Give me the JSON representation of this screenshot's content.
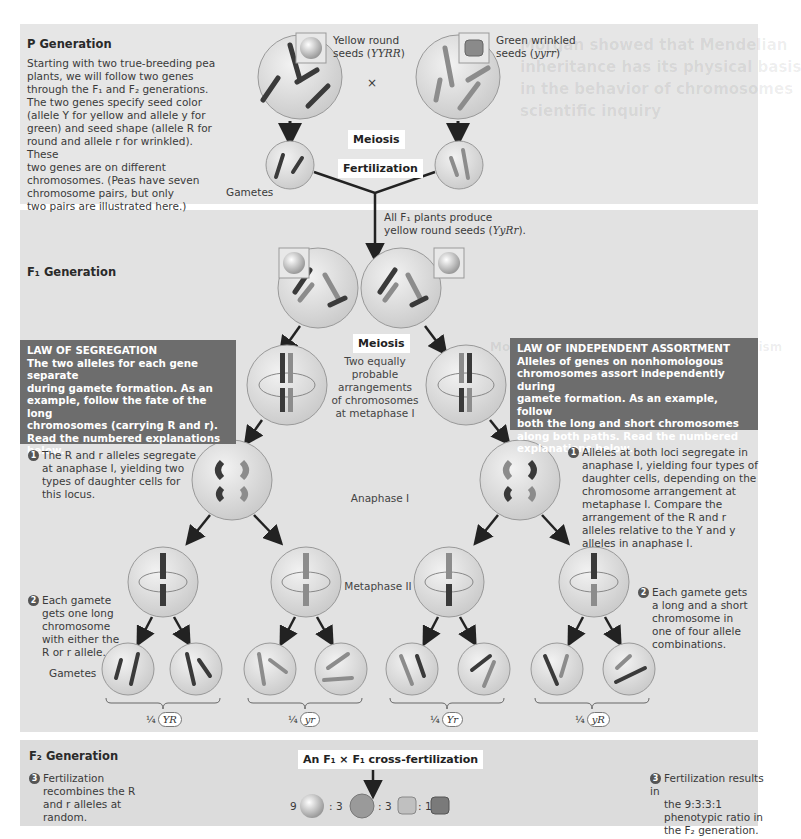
{
  "background_bleed": {
    "lines": [
      "Morgan showed that Mendelian",
      "inheritance has its physical basis",
      "in the behavior of chromosomes",
      "scientific inquiry"
    ],
    "subheading": "Morgan's Choice of Experimental Organism"
  },
  "p_generation": {
    "heading": "P Generation",
    "description": [
      "Starting with two true-breeding pea",
      "plants, we will follow two genes",
      "through the F₁ and F₂ generations.",
      "The two genes specify seed color",
      "(allele Y for yellow and allele y for",
      "green) and seed shape (allele R for",
      "round and allele r for wrinkled). These",
      "two genes are on different",
      "chromosomes. (Peas have seven",
      "chromosome pairs, but only",
      "two pairs are illustrated here.)"
    ],
    "parent_left": {
      "label_line1": "Yellow round",
      "label_line2": "seeds (",
      "genotype": "YYRR",
      "label_end": ")"
    },
    "cross_symbol": "×",
    "parent_right": {
      "label_line1": "Green wrinkled",
      "label_line2": "seeds (",
      "genotype": "yyrr",
      "label_end": ")"
    },
    "meiosis_label": "Meiosis",
    "fertilization_label": "Fertilization",
    "gametes_label": "Gametes",
    "gamete_left_alleles": [
      "R",
      "Y"
    ],
    "gamete_right_alleles": [
      "y",
      "r"
    ]
  },
  "f1_generation": {
    "heading": "F₁ Generation",
    "all_f1_line1": "All F₁ plants produce",
    "all_f1_line2": "yellow round seeds (",
    "all_f1_genotype": "YyRr",
    "all_f1_end": ").",
    "meiosis_label": "Meiosis",
    "metaphase1_label": [
      "Two equally",
      "probable",
      "arrangements",
      "of chromosomes",
      "at metaphase I"
    ],
    "anaphase1_label": "Anaphase I",
    "metaphase2_label": "Metaphase II",
    "gametes_label": "Gametes",
    "law_of_segregation": {
      "title": "LAW OF SEGREGATION",
      "text": [
        "The two alleles for each gene separate",
        "during gamete formation. As an",
        "example, follow the fate of the long",
        "chromosomes (carrying R and r).",
        "Read the numbered explanations",
        "below."
      ]
    },
    "law_of_independent_assortment": {
      "title": "LAW OF INDEPENDENT ASSORTMENT",
      "text": [
        "Alleles of genes on nonhomologous",
        "chromosomes assort independently during",
        "gamete formation. As an example, follow",
        "both the long and short chromosomes",
        "along both paths. Read the numbered",
        "explanations below."
      ]
    },
    "step1_left": {
      "num": "1",
      "lines": [
        "The R and r alleles segregate",
        "at anaphase I, yielding two",
        "types of daughter cells for",
        "this locus."
      ]
    },
    "step2_left": {
      "num": "2",
      "lines": [
        "Each gamete",
        "gets one long",
        "chromosome",
        "with either the",
        "R or r allele."
      ]
    },
    "step1_right": {
      "num": "1",
      "lines": [
        "Alleles at both loci segregate in",
        "anaphase I, yielding four types of",
        "daughter cells, depending on the",
        "chromosome arrangement at",
        "metaphase I. Compare the",
        "arrangement of the R and r",
        "alleles relative to the Y and y",
        "alleles in anaphase I."
      ]
    },
    "step2_right": {
      "num": "2",
      "lines": [
        "Each gamete gets",
        "a long and a short",
        "chromosome in",
        "one of four allele",
        "combinations."
      ]
    },
    "gamete_types": [
      {
        "fraction": "¼",
        "genotype": "YR"
      },
      {
        "fraction": "¼",
        "genotype": "yr"
      },
      {
        "fraction": "¼",
        "genotype": "Yr"
      },
      {
        "fraction": "¼",
        "genotype": "yR"
      }
    ],
    "allele_labels": {
      "R": "R",
      "r": "r",
      "Y": "Y",
      "y": "y"
    }
  },
  "f2_generation": {
    "heading": "F₂ Generation",
    "cross_label": "An F₁ × F₁ cross-fertilization",
    "step3_left": {
      "num": "3",
      "lines": [
        "Fertilization",
        "recombines the R",
        "and r alleles at",
        "random."
      ]
    },
    "step3_right": {
      "num": "3",
      "lines": [
        "Fertilization results in",
        "the 9:3:3:1",
        "phenotypic ratio in",
        "the F₂ generation."
      ]
    },
    "ratio": [
      {
        "count": "9",
        "phenotype": "yellow round"
      },
      {
        "count": ": 3",
        "phenotype": "green round"
      },
      {
        "count": ": 3",
        "phenotype": "yellow wrinkled"
      },
      {
        "count": ": 1",
        "phenotype": "green wrinkled"
      }
    ]
  },
  "colors": {
    "panel_bg": "#e2e2e2",
    "law_box_bg": "#6d6d6d",
    "cell_fill": "#d9d9d9",
    "chromosome_dark": "#3a3a3a",
    "chromosome_light": "#8c8c8c",
    "arrow": "#222222"
  }
}
